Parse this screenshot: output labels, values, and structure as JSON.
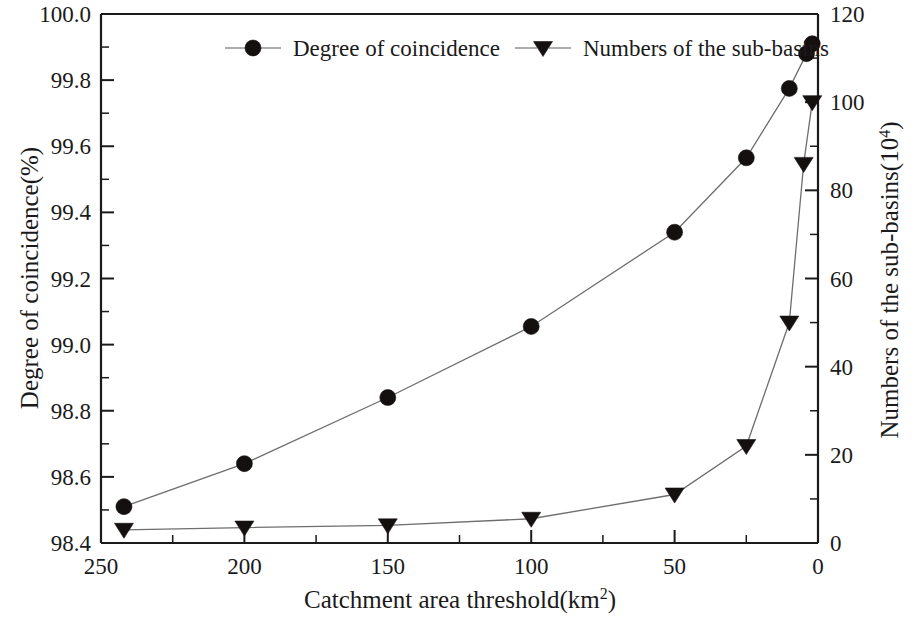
{
  "chart_data": {
    "type": "line",
    "title": "",
    "xlabel": "Catchment area threshold(km2)",
    "xlabel_base": "Catchment area threshold(km",
    "xlabel_sup": "2",
    "xlabel_close": ")",
    "x_ticks": [
      250,
      200,
      150,
      100,
      50,
      0
    ],
    "x_tick_labels": [
      "250",
      "200",
      "150",
      "100",
      "50",
      "0"
    ],
    "xlim": [
      250,
      0
    ],
    "x_reversed": true,
    "x_minor_per_interval": 1,
    "grid": false,
    "legend_position": "top-center-inside",
    "axes": [
      {
        "side": "left",
        "label": "Degree of coincidence(%)",
        "ylim": [
          98.4,
          100.0
        ],
        "ticks": [
          98.4,
          98.6,
          98.8,
          99.0,
          99.2,
          99.4,
          99.6,
          99.8,
          100.0
        ],
        "tick_labels": [
          "98.4",
          "98.6",
          "98.8",
          "99.0",
          "99.2",
          "99.4",
          "99.6",
          "99.8",
          "100.0"
        ]
      },
      {
        "side": "right",
        "label_base": "Numbers of the sub-basins(10",
        "label_sup": "4",
        "label_close": ")",
        "label": "Numbers of the sub-basins(104)",
        "ylim": [
          0,
          120
        ],
        "ticks": [
          0,
          20,
          40,
          60,
          80,
          100,
          120
        ],
        "tick_labels": [
          "0",
          "20",
          "40",
          "60",
          "80",
          "100",
          "120"
        ]
      }
    ],
    "series": [
      {
        "name": "Degree of coincidence",
        "axis": "left",
        "marker": "circle",
        "color": "#151010",
        "x": [
          242,
          200,
          150,
          100,
          50,
          25,
          10,
          4,
          2
        ],
        "values": [
          98.51,
          98.64,
          98.84,
          99.055,
          99.34,
          99.565,
          99.775,
          99.88,
          99.91
        ]
      },
      {
        "name": "Numbers of the sub-basins",
        "axis": "right",
        "marker": "triangle-down",
        "color": "#151010",
        "x": [
          242,
          200,
          150,
          100,
          50,
          25,
          10,
          5,
          2
        ],
        "values": [
          3,
          3.5,
          4,
          5.5,
          11,
          22,
          50,
          86,
          100
        ]
      }
    ]
  },
  "legend": {
    "items": [
      {
        "label": "Degree of coincidence",
        "marker": "circle"
      },
      {
        "label": "Numbers of the sub-basins",
        "marker": "triangle-down"
      }
    ]
  }
}
